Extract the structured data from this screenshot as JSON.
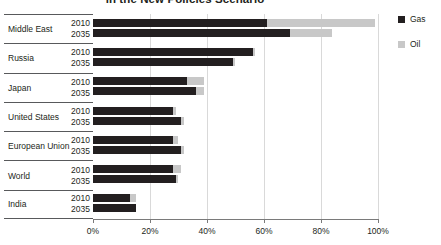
{
  "title": "in the New Policies Scenario",
  "legend": {
    "position": "right",
    "items": [
      {
        "label": "Gas",
        "color": "#231f20",
        "name": "gas"
      },
      {
        "label": "Oil",
        "color": "#c8c8c8",
        "name": "oil"
      }
    ]
  },
  "axis": {
    "tick_labels": [
      "0%",
      "20%",
      "40%",
      "60%",
      "80%",
      "100%"
    ],
    "tick_values": [
      0,
      20,
      40,
      60,
      80,
      100
    ],
    "min": 0,
    "max": 100
  },
  "chart_data": {
    "type": "bar",
    "orientation": "horizontal",
    "stacked": true,
    "title": "in the New Policies Scenario",
    "xlabel": "",
    "ylabel": "",
    "xlim": [
      0,
      100
    ],
    "grid": true,
    "legend_position": "right",
    "categories": [
      "Middle East",
      "Russia",
      "Japan",
      "United States",
      "European Union",
      "World",
      "India"
    ],
    "years": [
      "2010",
      "2035"
    ],
    "series": [
      {
        "name": "Gas",
        "color": "#231f20",
        "values_2010": [
          61,
          56,
          33,
          28,
          28,
          28,
          13
        ],
        "values_2035": [
          69,
          49,
          36,
          31,
          31,
          29,
          15
        ]
      },
      {
        "name": "Oil",
        "color": "#c8c8c8",
        "values_2010": [
          38,
          1,
          6,
          1,
          2,
          3,
          2
        ],
        "values_2035": [
          15,
          1,
          3,
          1,
          1,
          1,
          0
        ]
      }
    ],
    "rows": [
      {
        "category": "Middle East",
        "year": "2010",
        "gas": 61,
        "oil": 38
      },
      {
        "category": "Middle East",
        "year": "2035",
        "gas": 69,
        "oil": 15
      },
      {
        "category": "Russia",
        "year": "2010",
        "gas": 56,
        "oil": 1
      },
      {
        "category": "Russia",
        "year": "2035",
        "gas": 49,
        "oil": 1
      },
      {
        "category": "Japan",
        "year": "2010",
        "gas": 33,
        "oil": 6
      },
      {
        "category": "Japan",
        "year": "2035",
        "gas": 36,
        "oil": 3
      },
      {
        "category": "United States",
        "year": "2010",
        "gas": 28,
        "oil": 1
      },
      {
        "category": "United States",
        "year": "2035",
        "gas": 31,
        "oil": 1
      },
      {
        "category": "European Union",
        "year": "2010",
        "gas": 28,
        "oil": 2
      },
      {
        "category": "European Union",
        "year": "2035",
        "gas": 31,
        "oil": 1
      },
      {
        "category": "World",
        "year": "2010",
        "gas": 28,
        "oil": 3
      },
      {
        "category": "World",
        "year": "2035",
        "gas": 29,
        "oil": 1
      },
      {
        "category": "India",
        "year": "2010",
        "gas": 13,
        "oil": 2
      },
      {
        "category": "India",
        "year": "2035",
        "gas": 15,
        "oil": 0
      }
    ]
  }
}
